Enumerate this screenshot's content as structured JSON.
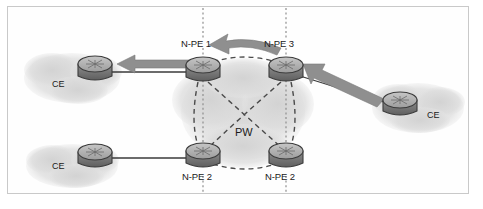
{
  "figure": {
    "background_color": "#ffffff",
    "frame_color": "#c9c9c9"
  },
  "colors": {
    "router_body": "#a8a8a8",
    "router_base": "#6e6e6e",
    "router_outline": "#3c3c3c",
    "cloud": "#dcdcdc",
    "link_line": "#3a3a3a",
    "arrow": "#8a8a8a",
    "pw_dash": "#4a4a4a",
    "boundary_dots": "#8e8e8e",
    "label_text": "#1a1a1a"
  },
  "nodes": [
    {
      "id": "ce-top-left",
      "label": "CE",
      "label_pos": "left",
      "type": "router",
      "x": 95,
      "y": 70
    },
    {
      "id": "ce-bottom-left",
      "label": "CE",
      "label_pos": "left",
      "type": "router",
      "x": 95,
      "y": 159
    },
    {
      "id": "ce-right",
      "label": "CE",
      "label_pos": "right",
      "type": "router",
      "x": 400,
      "y": 100
    },
    {
      "id": "n-pe-1",
      "label": "N-PE 1",
      "label_pos": "top",
      "type": "router",
      "x": 203,
      "y": 70
    },
    {
      "id": "n-pe-3",
      "label": "N-PE 3",
      "label_pos": "top",
      "type": "router",
      "x": 286,
      "y": 70
    },
    {
      "id": "n-pe-2-left",
      "label": "N-PE 2",
      "label_pos": "bottom",
      "type": "router",
      "x": 203,
      "y": 154
    },
    {
      "id": "n-pe-2-right",
      "label": "N-PE 2",
      "label_pos": "bottom",
      "type": "router",
      "x": 286,
      "y": 154
    }
  ],
  "annotations": {
    "pw_label": "PW"
  },
  "clouds": [
    {
      "id": "cloud-top-left",
      "label": "CE"
    },
    {
      "id": "cloud-bottom-left",
      "label": "CE"
    },
    {
      "id": "cloud-right",
      "label": "CE"
    },
    {
      "id": "cloud-core",
      "label": ""
    }
  ],
  "links": [
    {
      "from": "ce-top-left",
      "to": "n-pe-1",
      "style": "solid"
    },
    {
      "from": "ce-bottom-left",
      "to": "n-pe-2-left",
      "style": "solid"
    },
    {
      "from": "ce-right",
      "to": "n-pe-3",
      "style": "solid"
    }
  ],
  "pseudowires": [
    {
      "from": "n-pe-1",
      "to": "n-pe-3",
      "style": "dashed"
    },
    {
      "from": "n-pe-2-left",
      "to": "n-pe-2-right",
      "style": "dashed"
    },
    {
      "from": "n-pe-1",
      "to": "n-pe-2-left",
      "style": "dashed"
    },
    {
      "from": "n-pe-3",
      "to": "n-pe-2-right",
      "style": "dashed"
    },
    {
      "from": "n-pe-1",
      "to": "n-pe-2-right",
      "style": "dashed"
    },
    {
      "from": "n-pe-3",
      "to": "n-pe-2-left",
      "style": "dashed"
    }
  ],
  "traffic_arrows": [
    {
      "id": "arrow-to-ce-top-left",
      "direction": "left",
      "description": "traffic from N-PE 1 toward top-left CE"
    },
    {
      "id": "arrow-npe3-to-npe1",
      "direction": "left",
      "description": "curved traffic arrow from N-PE 3 to N-PE 1"
    },
    {
      "id": "arrow-ce-right-in",
      "direction": "up-left",
      "description": "traffic from right CE toward N-PE 3"
    }
  ],
  "boundary_lines": [
    {
      "id": "boundary-left",
      "label": "dotted vertical separator at N-PE 1 / N-PE 2"
    },
    {
      "id": "boundary-right",
      "label": "dotted vertical separator at N-PE 3 / N-PE 2"
    }
  ],
  "labels": {
    "n_pe_1": "N-PE 1",
    "n_pe_3": "N-PE 3",
    "n_pe_2_left": "N-PE 2",
    "n_pe_2_right": "N-PE 2",
    "ce_top_left": "CE",
    "ce_bottom_left": "CE",
    "ce_right": "CE",
    "pw": "PW"
  }
}
